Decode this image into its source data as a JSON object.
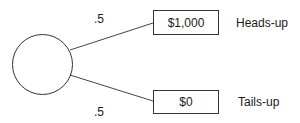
{
  "diagram": {
    "type": "decision-tree",
    "chance_node": "circle",
    "branches": [
      {
        "probability": ".5",
        "payoff": "$1,000",
        "outcome": "Heads-up"
      },
      {
        "probability": ".5",
        "payoff": "$0",
        "outcome": "Tails-up"
      }
    ]
  }
}
